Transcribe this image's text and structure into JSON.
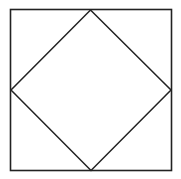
{
  "diagram": {
    "shapes": [
      {
        "name": "outer-square",
        "kind": "square",
        "rotation_deg": 0
      },
      {
        "name": "inscribed-diamond",
        "kind": "square",
        "rotation_deg": 45,
        "vertices_at": "midpoints of outer square sides"
      }
    ],
    "colors": {
      "background": "#ffffff",
      "line": "#222222"
    }
  }
}
